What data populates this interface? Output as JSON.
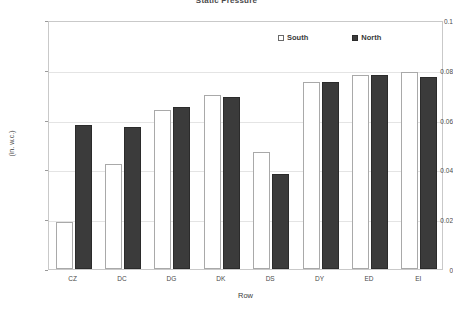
{
  "chart_data": {
    "type": "bar",
    "title": "Static Pressure",
    "xlabel": "Row",
    "ylabel": "(in. w.c.)",
    "ylim": [
      0,
      0.1
    ],
    "ytick_values": [
      0,
      0.02,
      0.04,
      0.06,
      0.08,
      0.1
    ],
    "ytick_labels": [
      "0",
      "0.02",
      "0.04",
      "0.06",
      "0.08",
      "0.1"
    ],
    "grid": true,
    "legend_position": "top-right-inside",
    "categories": [
      "CZ",
      "DC",
      "DG",
      "DK",
      "DS",
      "DY",
      "ED",
      "EI"
    ],
    "series": [
      {
        "name": "South",
        "color": "#ffffff",
        "edge_color": "#a9a9a9",
        "values": [
          0.019,
          0.042,
          0.064,
          0.07,
          0.047,
          0.075,
          0.078,
          0.079
        ]
      },
      {
        "name": "North",
        "color": "#3b3b3b",
        "edge_color": "#2b2b2b",
        "values": [
          0.058,
          0.057,
          0.065,
          0.069,
          0.038,
          0.075,
          0.078,
          0.077
        ]
      }
    ]
  },
  "legend": {
    "entries": [
      {
        "label": "South"
      },
      {
        "label": "North"
      }
    ]
  }
}
